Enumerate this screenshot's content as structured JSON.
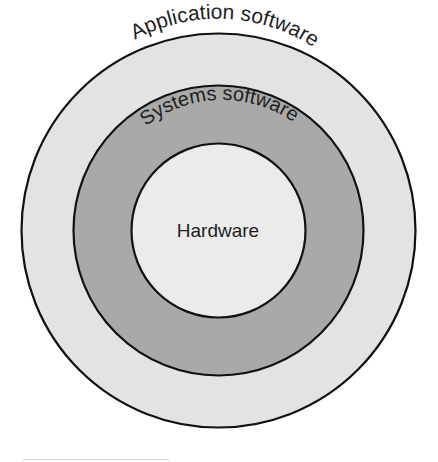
{
  "diagram": {
    "layers": [
      {
        "id": "application",
        "label": "Application software",
        "fill": "#e3e3e3",
        "stroke": "#111111",
        "radius": 197
      },
      {
        "id": "systems",
        "label": "Systems software",
        "fill": "#a9a9a9",
        "stroke": "#111111",
        "radius": 145
      },
      {
        "id": "hardware",
        "label": "Hardware",
        "fill": "#ebebeb",
        "stroke": "#111111",
        "radius": 87
      }
    ],
    "center": {
      "x": 218.5,
      "y": 230.5
    }
  }
}
